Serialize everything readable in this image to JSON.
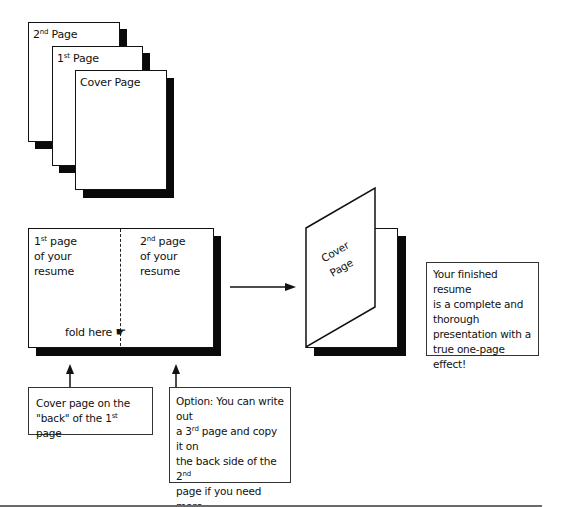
{
  "stack": {
    "pages": [
      {
        "label_main": "2",
        "label_sup": "nd",
        "label_rest": " Page"
      },
      {
        "label_main": "1",
        "label_sup": "st",
        "label_rest": " Page"
      },
      {
        "label_main": "Cover Page",
        "label_sup": "",
        "label_rest": ""
      }
    ]
  },
  "spread": {
    "left": {
      "line1_main": "1",
      "line1_sup": "st",
      "line1_rest": " page",
      "line2": "of your",
      "line3": "resume"
    },
    "right": {
      "line1_main": "2",
      "line1_sup": "nd",
      "line1_rest": " page",
      "line2": "of your",
      "line3": "resume"
    },
    "fold_label": "fold here",
    "fold_icon": "pointing-hand-icon",
    "fold_glyph": "☛"
  },
  "folded": {
    "cover_line1": "Cover",
    "cover_line2": "Page"
  },
  "result_box": {
    "text": "Your finished resume is a complete and thorough presentation with a true one-page effect!",
    "lines": [
      "Your finished resume",
      "is a complete and",
      "thorough",
      "presentation with a",
      "true one-page effect!"
    ]
  },
  "caption_left": {
    "line1": "Cover page on the",
    "line2_pre": "\"back\" of the 1",
    "line2_sup": "st",
    "line2_post": " page"
  },
  "caption_right": {
    "line1": "Option: You can write out",
    "line2_pre": "a 3",
    "line2_sup": "rd",
    "line2_post": " page and copy it on",
    "line3_pre": "the back side of the  2",
    "line3_sup": "nd",
    "line4": "page if you need more",
    "line5": "space."
  },
  "colors": {
    "ink": "#111111",
    "shadow": "#0a0a0a",
    "rule": "#6a6a6a",
    "background": "#ffffff"
  }
}
